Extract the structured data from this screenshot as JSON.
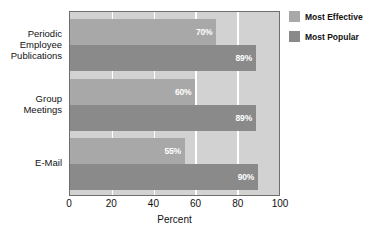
{
  "chart_data": {
    "type": "bar",
    "orientation": "horizontal",
    "title": "",
    "xlabel": "Percent",
    "ylabel": "",
    "xlim": [
      0,
      100
    ],
    "xticks": [
      0,
      20,
      40,
      60,
      80,
      100
    ],
    "xtick_labels": [
      "0",
      "20",
      "40",
      "60",
      "80",
      "100"
    ],
    "grid": true,
    "grid_axis": "x",
    "legend_position": "right",
    "categories": [
      "Periodic Employee Publications",
      "Group Meetings",
      "E-Mail"
    ],
    "category_label_lines": [
      [
        "Periodic",
        "Employee",
        "Publications"
      ],
      [
        "Group",
        "Meetings"
      ],
      [
        "E-Mail"
      ]
    ],
    "series": [
      {
        "name": "Most Effective",
        "color": "#a8a8a8",
        "values": [
          70,
          60,
          55
        ],
        "value_labels": [
          "70%",
          "60%",
          "55%"
        ]
      },
      {
        "name": "Most Popular",
        "color": "#8a8a8a",
        "values": [
          89,
          89,
          90
        ],
        "value_labels": [
          "89%",
          "89%",
          "90%"
        ]
      }
    ]
  },
  "legend": {
    "items": [
      {
        "label": "Most Effective",
        "color": "#a8a8a8"
      },
      {
        "label": "Most Popular",
        "color": "#8a8a8a"
      }
    ]
  },
  "colors": {
    "plot_background": "#d2d2d2",
    "gridline": "#ffffff",
    "border": "#6e6e6e",
    "most_effective": "#a8a8a8",
    "most_popular": "#8a8a8a",
    "value_label_text": "#ffffff"
  }
}
